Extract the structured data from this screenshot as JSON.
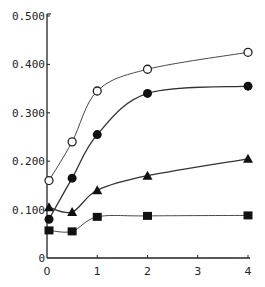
{
  "chart_data": {
    "type": "line",
    "title": "",
    "xlabel": "",
    "ylabel": "",
    "xlim": [
      0,
      4
    ],
    "ylim": [
      0,
      0.5
    ],
    "grid": false,
    "legend": null,
    "x_ticks": [
      "0",
      "1",
      "2",
      "3",
      "4"
    ],
    "y_ticks": [
      "0",
      "0.100",
      "0.200",
      "0.300",
      "0.400",
      "0.500"
    ],
    "series": [
      {
        "name": "open-circle",
        "marker": "open-circle",
        "x": [
          0,
          0.5,
          1,
          2,
          4
        ],
        "values": [
          0.16,
          0.24,
          0.345,
          0.39,
          0.425
        ]
      },
      {
        "name": "filled-circle",
        "marker": "filled-circle",
        "x": [
          0,
          0.5,
          1,
          2,
          4
        ],
        "values": [
          0.08,
          0.165,
          0.255,
          0.34,
          0.355
        ]
      },
      {
        "name": "filled-triangle",
        "marker": "filled-triangle",
        "x": [
          0,
          0.5,
          1,
          2,
          4
        ],
        "values": [
          0.105,
          0.095,
          0.14,
          0.17,
          0.205
        ]
      },
      {
        "name": "filled-square",
        "marker": "filled-square",
        "x": [
          0,
          0.5,
          1,
          2,
          4
        ],
        "values": [
          0.057,
          0.055,
          0.085,
          0.087,
          0.088
        ]
      }
    ]
  }
}
